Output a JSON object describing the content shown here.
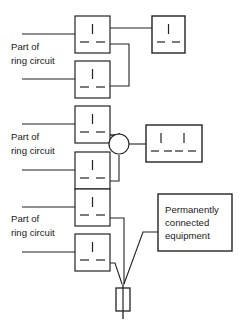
{
  "figure": {
    "type": "electrical-wiring-diagram",
    "title": "",
    "background_color": "#ffffff",
    "line_color": "#232323",
    "text_color": "#1a1a1a",
    "width": 240,
    "height": 326
  },
  "labels": {
    "ring_circuit_line1": "Part of",
    "ring_circuit_line2": "ring circuit",
    "equipment_line1": "Permanently",
    "equipment_line2": "connected",
    "equipment_line3": "equipment"
  },
  "rows": [
    {
      "id": "row-1",
      "caption": [
        "Part of",
        "ring circuit"
      ],
      "description": "Ring circuit sockets feeding a spur socket outlet",
      "symbols": [
        "socket-outlet",
        "socket-outlet",
        "spur-socket-outlet"
      ]
    },
    {
      "id": "row-2",
      "caption": [
        "Part of",
        "ring circuit"
      ],
      "description": "Ring circuit sockets feeding a junction box to a twin socket outlet",
      "symbols": [
        "socket-outlet",
        "socket-outlet",
        "junction-box",
        "twin-socket-outlet"
      ]
    },
    {
      "id": "row-3",
      "caption": [
        "Part of",
        "ring circuit"
      ],
      "description": "Ring circuit sockets feeding a fused connection unit to permanently connected equipment",
      "symbols": [
        "socket-outlet",
        "socket-outlet",
        "fuse",
        "equipment-box"
      ]
    }
  ]
}
